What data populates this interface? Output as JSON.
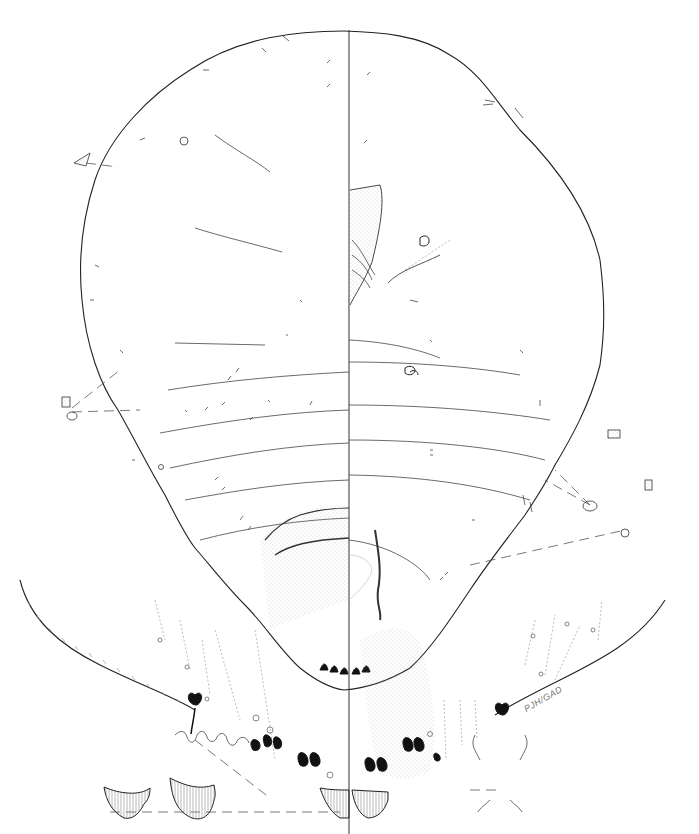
{
  "figure": {
    "type": "scientific-illustration",
    "colors": {
      "ink": "#222222",
      "background": "#ffffff",
      "stipple": "#999999"
    },
    "signature": "PJH/GAD",
    "panels": [
      {
        "name": "dorsum-half",
        "side": "left"
      },
      {
        "name": "venter-half",
        "side": "right"
      },
      {
        "name": "anal-lobe-enlargement",
        "position": "bottom"
      },
      {
        "name": "marginal-setae-enlargement-left",
        "position": "left"
      },
      {
        "name": "marginal-setae-enlargement-right",
        "position": "right"
      }
    ],
    "icons": [
      "spiracle-icon",
      "seta-icon",
      "pore-icon",
      "antenna-icon",
      "leg-icon",
      "anal-lobe-icon"
    ]
  }
}
